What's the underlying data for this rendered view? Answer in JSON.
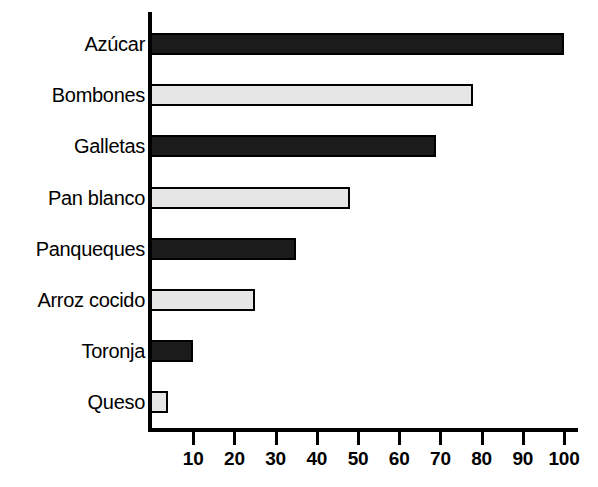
{
  "chart_data": {
    "type": "bar",
    "orientation": "horizontal",
    "title": "",
    "subtitle": "",
    "xlabel": "",
    "ylabel": "",
    "xlim": [
      0,
      100
    ],
    "ylim": null,
    "grid": false,
    "legend": null,
    "xticks": [
      10,
      20,
      30,
      40,
      50,
      60,
      70,
      80,
      90,
      100
    ],
    "xtick_labels": [
      "10",
      "20",
      "30",
      "40",
      "50",
      "60",
      "70",
      "80",
      "90",
      "100"
    ],
    "categories": [
      "Azúcar",
      "Bombones",
      "Galletas",
      "Pan blanco",
      "Panqueques",
      "Arroz cocido",
      "Toronja",
      "Queso"
    ],
    "values": [
      100,
      78,
      69,
      48,
      35,
      25,
      10,
      4
    ],
    "bar_styles": [
      "dark",
      "light",
      "dark",
      "light",
      "dark",
      "light",
      "dark",
      "light"
    ],
    "colors": {
      "dark_bar": "#1b1b1b",
      "light_bar": "#e6e6e6",
      "bar_border": "#000000",
      "axis": "#000000",
      "background": "#ffffff",
      "text": "#000000"
    },
    "bars": [
      {
        "label": "Azúcar",
        "value": 100,
        "style": "dark"
      },
      {
        "label": "Bombones",
        "value": 78,
        "style": "light"
      },
      {
        "label": "Galletas",
        "value": 69,
        "style": "dark"
      },
      {
        "label": "Pan blanco",
        "value": 48,
        "style": "light"
      },
      {
        "label": "Panqueques",
        "value": 35,
        "style": "dark"
      },
      {
        "label": "Arroz cocido",
        "value": 25,
        "style": "light"
      },
      {
        "label": "Toronja",
        "value": 10,
        "style": "dark"
      },
      {
        "label": "Queso",
        "value": 4,
        "style": "light"
      }
    ]
  }
}
